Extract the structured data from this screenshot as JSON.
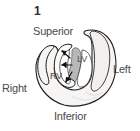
{
  "figure": {
    "panel_number": "1",
    "type": "cardiac-short-axis-diagram",
    "background_color": "#ffffff",
    "outline_color": "#1f1f1f",
    "myocardium_fill": "#f6f4f2",
    "septum_fill": "#b9b9b9",
    "cavity_fill": "#ffffff",
    "text_color": "#4a4a4a"
  },
  "orientation_labels": {
    "superior": "Superior",
    "inferior": "Inferior",
    "right": "Right",
    "left": "Left"
  },
  "chamber_labels": {
    "left_ventricle": "LV",
    "right_ventricle": "RV"
  },
  "arrows": [
    {
      "name": "arrow-upper-left",
      "direction": "up-left"
    },
    {
      "name": "arrow-left",
      "direction": "left"
    },
    {
      "name": "arrow-lower-left",
      "direction": "down-left"
    }
  ]
}
